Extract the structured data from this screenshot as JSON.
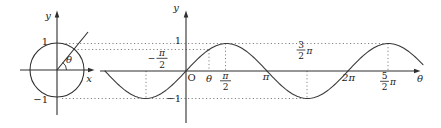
{
  "palette": {
    "background": "#ffffff",
    "ink": "#2e2e2e",
    "text": "#1c1c1c",
    "dotted_line": "#6e6e6e"
  },
  "unit_circle": {
    "y_axis_label": "y",
    "x_axis_label": "x",
    "one_label": "1",
    "minus_one_label": "−1",
    "angle_label": "θ",
    "angle_radians": 0.89
  },
  "sine_plot": {
    "y_axis_label": "y",
    "x_axis_label": "θ",
    "origin_label": "O",
    "one_label": "1",
    "minus_one_label": "−1",
    "tick_theta": "θ",
    "tick_pi": "π",
    "tick_two_pi": "2π",
    "frac_neg_half_pi": {
      "sign": "−",
      "num": "π",
      "den": "2"
    },
    "frac_half_pi": {
      "num": "π",
      "den": "2"
    },
    "frac_three_halves_pi": {
      "num": "3",
      "den": "2",
      "mult": "π"
    },
    "frac_five_halves_pi": {
      "num": "5",
      "den": "2",
      "mult": "π"
    }
  },
  "curve": {
    "function": "y = sin(θ)",
    "origin_x": 186,
    "axis_y": 71,
    "pixels_per_pi": 81,
    "amplitude_px": 27.5,
    "x_start": 105,
    "x_end": 423,
    "theta_marker_px": 209
  },
  "chart_data": {
    "type": "line",
    "series": [
      {
        "name": "sin θ",
        "function": "y = sin(θ)"
      }
    ],
    "x_unit": "radians",
    "x_range_pi": [
      -1,
      2.93
    ],
    "y_range": [
      -1,
      1
    ],
    "y_ticks": [
      -1,
      1
    ],
    "x_tick_labels": [
      "−π/2",
      "θ",
      "π/2",
      "π",
      "3/2π",
      "2π",
      "5/2π"
    ],
    "x_tick_values_rad": [
      -1.5708,
      0.89,
      1.5708,
      3.1416,
      4.7124,
      6.2832,
      7.854
    ],
    "key_points": [
      {
        "x_rad": -1.5708,
        "y": -1
      },
      {
        "x_rad": 1.5708,
        "y": 1
      },
      {
        "x_rad": 4.7124,
        "y": -1
      },
      {
        "x_rad": 7.854,
        "y": 1
      }
    ],
    "annotations": [
      "unit circle of radius 1 with central angle θ whose terminal side height defines sin θ"
    ],
    "grid": "dotted projection lines only",
    "legend": "none"
  }
}
